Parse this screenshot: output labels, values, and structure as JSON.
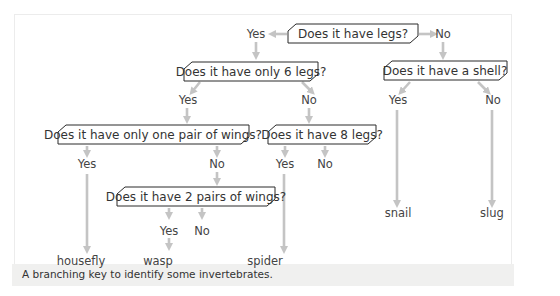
{
  "diagram": {
    "type": "branching-key",
    "questions": [
      {
        "id": "q1",
        "text": "Does it have legs?"
      },
      {
        "id": "q2",
        "text": "Does it have only 6 legs?"
      },
      {
        "id": "q3",
        "text": "Does it have a shell?"
      },
      {
        "id": "q4",
        "text": "Does it have only one pair of wings?"
      },
      {
        "id": "q5",
        "text": "Does it have 8 legs?"
      },
      {
        "id": "q6",
        "text": "Does it have 2 pairs of wings?"
      }
    ],
    "answers": {
      "yes": "Yes",
      "no": "No"
    },
    "results": {
      "housefly": "housefly",
      "wasp": "wasp",
      "spider": "spider",
      "snail": "snail",
      "slug": "slug"
    },
    "edges": [
      {
        "from": "q1",
        "label": "Yes",
        "to": "q2"
      },
      {
        "from": "q1",
        "label": "No",
        "to": "q3"
      },
      {
        "from": "q2",
        "label": "Yes",
        "to": "q4"
      },
      {
        "from": "q2",
        "label": "No",
        "to": "q5"
      },
      {
        "from": "q3",
        "label": "Yes",
        "to": "snail"
      },
      {
        "from": "q3",
        "label": "No",
        "to": "slug"
      },
      {
        "from": "q4",
        "label": "Yes",
        "to": "housefly"
      },
      {
        "from": "q4",
        "label": "No",
        "to": "q6"
      },
      {
        "from": "q5",
        "label": "Yes",
        "to": "spider"
      },
      {
        "from": "q5",
        "label": "No",
        "to": null
      },
      {
        "from": "q6",
        "label": "Yes",
        "to": "wasp"
      },
      {
        "from": "q6",
        "label": "No",
        "to": null
      }
    ],
    "colors": {
      "arrow": "#c4c4c4",
      "box_border": "#2a2a2a",
      "text": "#333333"
    }
  },
  "caption": "A branching key to identify some invertebrates."
}
